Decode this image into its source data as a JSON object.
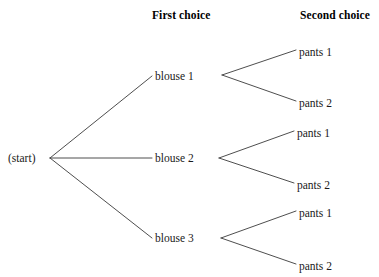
{
  "diagram": {
    "type": "probability-tree",
    "title": "",
    "line_color": "#3a3a3a",
    "text_color": "#1a1a1a",
    "background": "#ffffff",
    "headers": [
      {
        "label": "First choice",
        "x": 192,
        "y": 16
      },
      {
        "label": "Second choice",
        "x": 337,
        "y": 16
      }
    ],
    "root": {
      "label": "(start)",
      "x": 8,
      "y": 158,
      "vertex_x": 50,
      "vertex_y": 158
    },
    "stage1": [
      {
        "label": "blouse 1",
        "x": 155,
        "y": 76,
        "vertex_x": 222
      },
      {
        "label": "blouse 2",
        "x": 155,
        "y": 158,
        "vertex_x": 219
      },
      {
        "label": "blouse 3",
        "x": 155,
        "y": 238,
        "vertex_x": 221
      }
    ],
    "stage2": [
      {
        "label": "pants 1",
        "x": 299,
        "y": 52,
        "parent": 0
      },
      {
        "label": "pants 2",
        "x": 299,
        "y": 103,
        "parent": 0
      },
      {
        "label": "pants 1",
        "x": 297,
        "y": 133,
        "parent": 1
      },
      {
        "label": "pants 2",
        "x": 297,
        "y": 185,
        "parent": 1
      },
      {
        "label": "pants 1",
        "x": 299,
        "y": 213,
        "parent": 2
      },
      {
        "label": "pants 2",
        "x": 299,
        "y": 266,
        "parent": 2
      }
    ],
    "edges_stage1": [
      {
        "x1": 50,
        "y1": 158,
        "x2": 152,
        "y2": 76
      },
      {
        "x1": 50,
        "y1": 158,
        "x2": 152,
        "y2": 158
      },
      {
        "x1": 50,
        "y1": 158,
        "x2": 152,
        "y2": 238
      }
    ],
    "edges_stage2": [
      {
        "x1": 222,
        "y1": 75,
        "x2": 296,
        "y2": 50
      },
      {
        "x1": 222,
        "y1": 75,
        "x2": 296,
        "y2": 101
      },
      {
        "x1": 219,
        "y1": 158,
        "x2": 294,
        "y2": 131
      },
      {
        "x1": 219,
        "y1": 158,
        "x2": 294,
        "y2": 183
      },
      {
        "x1": 221,
        "y1": 238,
        "x2": 296,
        "y2": 211
      },
      {
        "x1": 221,
        "y1": 238,
        "x2": 296,
        "y2": 264
      }
    ]
  }
}
